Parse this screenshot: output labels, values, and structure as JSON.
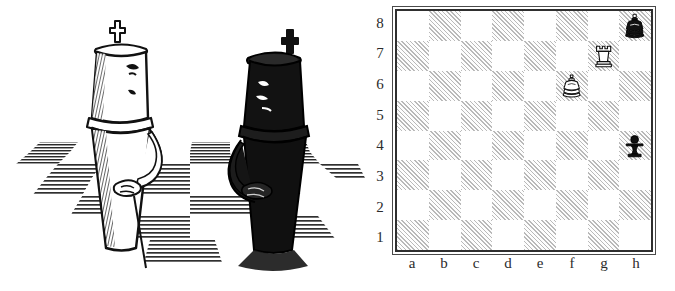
{
  "illustration": {
    "name": "chess-kings-cartoon",
    "description": "Pen-and-ink drawing of two anthropomorphic chess kings facing each other on a perspective checkerboard floor, arms held behind their backs",
    "figures": [
      {
        "name": "white-king-figure",
        "color": "white",
        "side": "left",
        "expression": "frowning",
        "finial": "cross"
      },
      {
        "name": "black-king-figure",
        "color": "black",
        "side": "right",
        "expression": "frowning",
        "finial": "cross"
      }
    ],
    "floor": "perspective-checkerboard"
  },
  "diagram": {
    "name": "chess-position-diagram",
    "rank_labels": [
      "8",
      "7",
      "6",
      "5",
      "4",
      "3",
      "2",
      "1"
    ],
    "file_labels": [
      "a",
      "b",
      "c",
      "d",
      "e",
      "f",
      "g",
      "h"
    ],
    "light_square_color": "#ffffff",
    "dark_square_color": "#b9b9b9",
    "border_color": "#2f2f2f",
    "label_color": "#2b2b2b"
  },
  "chart_data": {
    "type": "table",
    "categories": [
      "a",
      "b",
      "c",
      "d",
      "e",
      "f",
      "g",
      "h"
    ],
    "rows": [
      "8",
      "7",
      "6",
      "5",
      "4",
      "3",
      "2",
      "1"
    ],
    "pieces": [
      {
        "piece": "king",
        "color": "black",
        "square": "h8",
        "file": "h",
        "rank": "8",
        "glyph": "black-king"
      },
      {
        "piece": "rook",
        "color": "white",
        "square": "g7",
        "file": "g",
        "rank": "7",
        "glyph": "white-rook"
      },
      {
        "piece": "king",
        "color": "white",
        "square": "f6",
        "file": "f",
        "rank": "6",
        "glyph": "white-king"
      },
      {
        "piece": "pawn",
        "color": "black",
        "square": "h4",
        "file": "h",
        "rank": "4",
        "glyph": "black-pawn"
      }
    ],
    "fen": "7k/6R1/5K2/8/7p/8/8/8",
    "xlabel": "",
    "ylabel": "",
    "grid": true,
    "legend": false
  }
}
